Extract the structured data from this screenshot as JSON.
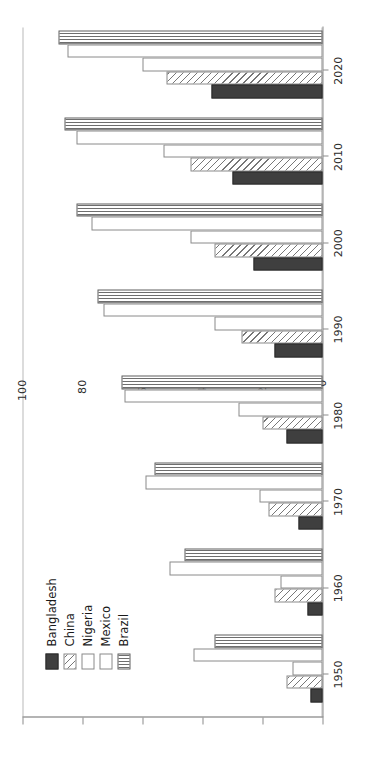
{
  "chart_data": {
    "type": "bar",
    "orientation": "rotated-90",
    "title": "",
    "xlabel": "",
    "ylabel": "",
    "categories": [
      "1950",
      "1960",
      "1970",
      "1980",
      "1990",
      "2000",
      "2010",
      "2020"
    ],
    "ylim": [
      0,
      100
    ],
    "yticks": [
      "0",
      "20",
      "40",
      "60",
      "80",
      "100"
    ],
    "ytick_values": [
      0,
      20,
      40,
      60,
      80,
      100
    ],
    "grid": false,
    "legend_position": "upper-left",
    "series": [
      {
        "name": "Bangladesh",
        "fill": "solid-dark",
        "color": "#3f3f3f",
        "values": [
          4,
          5,
          8,
          12,
          16,
          23,
          30,
          37
        ]
      },
      {
        "name": "China",
        "fill": "diagonal-hatch",
        "color": "#777777",
        "values": [
          12,
          16,
          18,
          20,
          27,
          36,
          44,
          52
        ]
      },
      {
        "name": "Nigeria",
        "fill": "empty",
        "color": "#ffffff",
        "values": [
          10,
          14,
          21,
          28,
          36,
          44,
          53,
          60
        ]
      },
      {
        "name": "Mexico",
        "fill": "empty",
        "color": "#ffffff",
        "values": [
          43,
          51,
          59,
          66,
          73,
          77,
          82,
          85
        ]
      },
      {
        "name": "Brazil",
        "fill": "vertical-stripe",
        "color": "#6e6e6e",
        "values": [
          36,
          46,
          56,
          67,
          75,
          82,
          86,
          88
        ]
      }
    ]
  },
  "legend": {
    "items": [
      {
        "label": "Bangladesh"
      },
      {
        "label": "China"
      },
      {
        "label": "Nigeria"
      },
      {
        "label": "Mexico"
      },
      {
        "label": "Brazil"
      }
    ]
  }
}
